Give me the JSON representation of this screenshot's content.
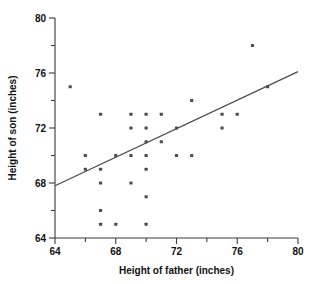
{
  "figure": {
    "clipped_top_text": "",
    "background_color": "#ffffff",
    "point_color": "#4d4d4d",
    "line_color": "#4a4a4a",
    "axis_color": "#3a3a3a"
  },
  "chart_data": {
    "type": "scatter",
    "title": "",
    "xlabel": "Height of father (inches)",
    "ylabel": "Height of son (inches)",
    "xlim": [
      64,
      80
    ],
    "ylim": [
      64,
      80
    ],
    "xticks": [
      64,
      66,
      68,
      70,
      72,
      74,
      76,
      78,
      80
    ],
    "yticks": [
      64,
      66,
      68,
      70,
      72,
      74,
      76,
      78,
      80
    ],
    "xtick_labels": [
      "64",
      "",
      "68",
      "",
      "72",
      "",
      "76",
      "",
      "80"
    ],
    "ytick_labels": [
      "64",
      "",
      "68",
      "",
      "72",
      "",
      "76",
      "",
      "80"
    ],
    "grid": false,
    "legend": null,
    "points": [
      {
        "x": 65.0,
        "y": 75.0
      },
      {
        "x": 66.0,
        "y": 70.0
      },
      {
        "x": 66.0,
        "y": 69.0
      },
      {
        "x": 67.0,
        "y": 73.0
      },
      {
        "x": 67.0,
        "y": 69.0
      },
      {
        "x": 67.0,
        "y": 68.0
      },
      {
        "x": 67.0,
        "y": 66.0
      },
      {
        "x": 67.0,
        "y": 65.0
      },
      {
        "x": 68.0,
        "y": 70.0
      },
      {
        "x": 68.0,
        "y": 65.0
      },
      {
        "x": 69.0,
        "y": 73.0
      },
      {
        "x": 69.0,
        "y": 72.0
      },
      {
        "x": 69.0,
        "y": 70.0
      },
      {
        "x": 69.0,
        "y": 68.0
      },
      {
        "x": 70.0,
        "y": 73.0
      },
      {
        "x": 70.0,
        "y": 72.0
      },
      {
        "x": 70.0,
        "y": 71.0
      },
      {
        "x": 70.0,
        "y": 70.0
      },
      {
        "x": 70.0,
        "y": 69.0
      },
      {
        "x": 70.0,
        "y": 67.0
      },
      {
        "x": 70.0,
        "y": 65.0
      },
      {
        "x": 71.0,
        "y": 73.0
      },
      {
        "x": 71.0,
        "y": 71.0
      },
      {
        "x": 72.0,
        "y": 72.0
      },
      {
        "x": 72.0,
        "y": 70.0
      },
      {
        "x": 73.0,
        "y": 74.0
      },
      {
        "x": 73.0,
        "y": 70.0
      },
      {
        "x": 75.0,
        "y": 73.0
      },
      {
        "x": 75.0,
        "y": 72.0
      },
      {
        "x": 76.0,
        "y": 73.0
      },
      {
        "x": 77.0,
        "y": 78.0
      },
      {
        "x": 78.0,
        "y": 75.0
      }
    ],
    "fit_line": {
      "x0": 64.0,
      "y0": 67.8,
      "x1": 80.0,
      "y1": 76.1
    }
  }
}
